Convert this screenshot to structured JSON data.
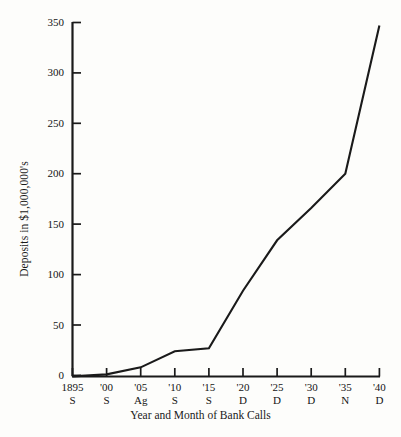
{
  "chart_data": {
    "type": "line",
    "title": "",
    "subtitle": "",
    "xlabel": "Year and Month of Bank Calls",
    "ylabel": "Deposits in $1,000,000's",
    "grid": false,
    "legend": false,
    "legend_position": "none",
    "series_color": "#1a1a1a",
    "background_color": "#fdfdfb",
    "axis_color": "#1a1a1a",
    "xlim": [
      0,
      9
    ],
    "ylim": [
      0,
      350
    ],
    "y_ticks": [
      0,
      50,
      100,
      150,
      200,
      250,
      300,
      350
    ],
    "y_tick_labels": [
      "0",
      "50",
      "100",
      "150",
      "200",
      "250",
      "300",
      "350"
    ],
    "categories": [
      "1895",
      "'00",
      "'05",
      "'10",
      "'15",
      "'20",
      "'25",
      "'30",
      "'35",
      "'40"
    ],
    "category_months": [
      "S",
      "S",
      "Ag",
      "S",
      "S",
      "D",
      "D",
      "D",
      "N",
      "D"
    ],
    "x_tick_labels": [
      {
        "year": "1895",
        "month": "S"
      },
      {
        "year": "'00",
        "month": "S"
      },
      {
        "year": "'05",
        "month": "Ag"
      },
      {
        "year": "'10",
        "month": "S"
      },
      {
        "year": "'15",
        "month": "S"
      },
      {
        "year": "'20",
        "month": "D"
      },
      {
        "year": "'25",
        "month": "D"
      },
      {
        "year": "'30",
        "month": "D"
      },
      {
        "year": "'35",
        "month": "N"
      },
      {
        "year": "'40",
        "month": "D"
      }
    ],
    "series": [
      {
        "name": "Deposits",
        "values": [
          -1,
          1,
          8,
          24,
          27,
          84,
          134,
          166,
          200,
          347
        ]
      }
    ]
  }
}
